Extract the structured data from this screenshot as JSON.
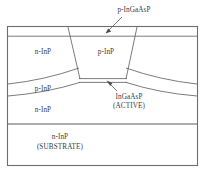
{
  "figure": {
    "kind": "semiconductor-cross-section",
    "title_visible": false,
    "stroke_color": "#4a4a4a",
    "frame_color": "#6e6e6e",
    "background": "#ffffff"
  },
  "callouts": [
    {
      "id": "cap-layer",
      "text": "p-InGaAsP",
      "x": 104,
      "y": 6,
      "width": 60,
      "leader": "arrow pointing down-left to top cap layer"
    },
    {
      "id": "active-layer",
      "line1": "InGaAsP",
      "line2": "(ACTIVE)",
      "text": "InGaAsP\n(ACTIVE)",
      "x": 100,
      "y": 93,
      "width": 58,
      "leader": "arrow pointing up-left to thin active stripe"
    }
  ],
  "regions": [
    {
      "id": "left-upper-blocking",
      "text": "n-InP",
      "x": 22,
      "y": 48,
      "width": 42
    },
    {
      "id": "center-mesa",
      "text": "p-InP",
      "x": 85,
      "y": 48,
      "width": 42
    },
    {
      "id": "left-p-layer",
      "text": "p-InP",
      "x": 22,
      "y": 85,
      "width": 42
    },
    {
      "id": "left-n-layer",
      "text": "n-InP",
      "x": 22,
      "y": 106,
      "width": 42
    },
    {
      "id": "substrate",
      "line1": "n-InP",
      "line2": "(SUBSTRATE)",
      "text": "n-InP\n(SUBSTRATE)",
      "x": 22,
      "y": 133,
      "width": 76
    }
  ],
  "geometry": {
    "frame": {
      "x": 7,
      "y": 26,
      "width": 191,
      "height": 140
    },
    "cap_layer_y": 36,
    "active_stripe_y": [
      78,
      82
    ],
    "substrate_divider_y": 124,
    "mesa_top_left_x": 68,
    "mesa_top_right_x": 137,
    "mesa_bottom_left_x": 80,
    "mesa_bottom_right_x": 126
  }
}
